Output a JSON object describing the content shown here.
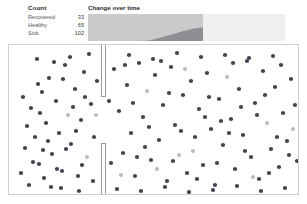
{
  "legend": {
    "title": "Count",
    "rows": [
      {
        "label": "Recovered",
        "value": "33"
      },
      {
        "label": "Healthy",
        "value": "65"
      },
      {
        "label": "Sick",
        "value": "102"
      }
    ]
  },
  "timeline": {
    "title": "Change over time"
  },
  "colors": {
    "sick_dot": "#3f4450",
    "recovered_dot": "#b9bcc4",
    "healthy_dot": "#6f7480",
    "area_band_dark": "#8d8f93",
    "area_band_light": "#c9cacc",
    "chart_background": "#f1f1f1",
    "panel_border": "#cfcfcf",
    "wall": "#9b9b9b",
    "text": "#333333"
  },
  "chart_data": {
    "type": "area",
    "title": "Change over time",
    "xlabel": "",
    "ylabel": "",
    "grid": false,
    "legend_position": "none",
    "stacked": true,
    "xlim": [
      0,
      100
    ],
    "ylim": [
      0,
      200
    ],
    "x": [
      0,
      10,
      20,
      30,
      40,
      50,
      55,
      60,
      65,
      70,
      75,
      80,
      85,
      90,
      95,
      100
    ],
    "series": [
      {
        "name": "Sick",
        "color": "#c9cacc",
        "values": [
          200,
          200,
          200,
          200,
          200,
          198,
          192,
          182,
          170,
          158,
          146,
          134,
          122,
          112,
          104,
          100
        ]
      },
      {
        "name": "Recovered",
        "color": "#8d8f93",
        "values": [
          0,
          0,
          0,
          0,
          0,
          2,
          8,
          18,
          30,
          42,
          54,
          66,
          78,
          88,
          96,
          100
        ]
      }
    ],
    "annotations": [
      {
        "text": "elapsed portion shaded darker, remaining time lighter",
        "x": 100,
        "y": 0
      }
    ]
  },
  "simulation": {
    "label": "particle-simulation-field",
    "walls": [
      {
        "name": "upper-wall",
        "x": 92,
        "y": 0,
        "width": 4,
        "height": 52
      },
      {
        "name": "lower-wall",
        "x": 92,
        "y": 99,
        "width": 4,
        "height": 52
      }
    ],
    "dots": [
      {
        "x": 16,
        "y": 103,
        "t": "s"
      },
      {
        "x": 22,
        "y": 63,
        "t": "s"
      },
      {
        "x": 26,
        "y": 92,
        "t": "s"
      },
      {
        "x": 30,
        "y": 119,
        "t": "s"
      },
      {
        "x": 33,
        "y": 47,
        "t": "s"
      },
      {
        "x": 37,
        "y": 78,
        "t": "s"
      },
      {
        "x": 40,
        "y": 33,
        "t": "s"
      },
      {
        "x": 43,
        "y": 109,
        "t": "s"
      },
      {
        "x": 47,
        "y": 56,
        "t": "s"
      },
      {
        "x": 50,
        "y": 88,
        "t": "s"
      },
      {
        "x": 53,
        "y": 126,
        "t": "s"
      },
      {
        "x": 56,
        "y": 20,
        "t": "s"
      },
      {
        "x": 59,
        "y": 70,
        "t": "r"
      },
      {
        "x": 62,
        "y": 99,
        "t": "s"
      },
      {
        "x": 66,
        "y": 44,
        "t": "s"
      },
      {
        "x": 69,
        "y": 131,
        "t": "s"
      },
      {
        "x": 72,
        "y": 75,
        "t": "s"
      },
      {
        "x": 75,
        "y": 27,
        "t": "s"
      },
      {
        "x": 78,
        "y": 112,
        "t": "r"
      },
      {
        "x": 82,
        "y": 59,
        "t": "s"
      },
      {
        "x": 85,
        "y": 92,
        "t": "s"
      },
      {
        "x": 88,
        "y": 36,
        "t": "s"
      },
      {
        "x": 20,
        "y": 140,
        "t": "s"
      },
      {
        "x": 28,
        "y": 14,
        "t": "s"
      },
      {
        "x": 35,
        "y": 133,
        "t": "s"
      },
      {
        "x": 45,
        "y": 17,
        "t": "s"
      },
      {
        "x": 52,
        "y": 143,
        "t": "s"
      },
      {
        "x": 61,
        "y": 12,
        "t": "s"
      },
      {
        "x": 70,
        "y": 146,
        "t": "s"
      },
      {
        "x": 80,
        "y": 9,
        "t": "s"
      },
      {
        "x": 14,
        "y": 52,
        "t": "s"
      },
      {
        "x": 18,
        "y": 81,
        "t": "s"
      },
      {
        "x": 24,
        "y": 117,
        "t": "s"
      },
      {
        "x": 31,
        "y": 68,
        "t": "s"
      },
      {
        "x": 39,
        "y": 96,
        "t": "s"
      },
      {
        "x": 48,
        "y": 124,
        "t": "s"
      },
      {
        "x": 57,
        "y": 104,
        "t": "s"
      },
      {
        "x": 64,
        "y": 62,
        "t": "s"
      },
      {
        "x": 73,
        "y": 120,
        "t": "s"
      },
      {
        "x": 84,
        "y": 136,
        "t": "s"
      },
      {
        "x": 12,
        "y": 128,
        "t": "s"
      },
      {
        "x": 29,
        "y": 39,
        "t": "s"
      },
      {
        "x": 42,
        "y": 142,
        "t": "s"
      },
      {
        "x": 54,
        "y": 34,
        "t": "s"
      },
      {
        "x": 67,
        "y": 86,
        "t": "s"
      },
      {
        "x": 76,
        "y": 52,
        "t": "s"
      },
      {
        "x": 87,
        "y": 70,
        "t": "r"
      },
      {
        "x": 34,
        "y": 105,
        "t": "s"
      },
      {
        "x": 105,
        "y": 24,
        "t": "s"
      },
      {
        "x": 110,
        "y": 66,
        "t": "s"
      },
      {
        "x": 114,
        "y": 108,
        "t": "s"
      },
      {
        "x": 118,
        "y": 40,
        "t": "s"
      },
      {
        "x": 122,
        "y": 88,
        "t": "s"
      },
      {
        "x": 126,
        "y": 131,
        "t": "s"
      },
      {
        "x": 130,
        "y": 18,
        "t": "s"
      },
      {
        "x": 134,
        "y": 72,
        "t": "s"
      },
      {
        "x": 138,
        "y": 46,
        "t": "r"
      },
      {
        "x": 142,
        "y": 115,
        "t": "s"
      },
      {
        "x": 146,
        "y": 30,
        "t": "s"
      },
      {
        "x": 150,
        "y": 95,
        "t": "s"
      },
      {
        "x": 154,
        "y": 60,
        "t": "s"
      },
      {
        "x": 158,
        "y": 136,
        "t": "s"
      },
      {
        "x": 162,
        "y": 22,
        "t": "s"
      },
      {
        "x": 166,
        "y": 80,
        "t": "s"
      },
      {
        "x": 170,
        "y": 110,
        "t": "r"
      },
      {
        "x": 174,
        "y": 50,
        "t": "s"
      },
      {
        "x": 178,
        "y": 128,
        "t": "s"
      },
      {
        "x": 182,
        "y": 36,
        "t": "s"
      },
      {
        "x": 186,
        "y": 92,
        "t": "s"
      },
      {
        "x": 190,
        "y": 64,
        "t": "s"
      },
      {
        "x": 194,
        "y": 120,
        "t": "s"
      },
      {
        "x": 198,
        "y": 28,
        "t": "s"
      },
      {
        "x": 202,
        "y": 84,
        "t": "s"
      },
      {
        "x": 206,
        "y": 140,
        "t": "s"
      },
      {
        "x": 210,
        "y": 54,
        "t": "s"
      },
      {
        "x": 214,
        "y": 100,
        "t": "s"
      },
      {
        "x": 218,
        "y": 32,
        "t": "r"
      },
      {
        "x": 222,
        "y": 74,
        "t": "s"
      },
      {
        "x": 226,
        "y": 124,
        "t": "s"
      },
      {
        "x": 230,
        "y": 44,
        "t": "s"
      },
      {
        "x": 234,
        "y": 90,
        "t": "s"
      },
      {
        "x": 238,
        "y": 16,
        "t": "s"
      },
      {
        "x": 242,
        "y": 112,
        "t": "s"
      },
      {
        "x": 246,
        "y": 58,
        "t": "s"
      },
      {
        "x": 250,
        "y": 134,
        "t": "s"
      },
      {
        "x": 254,
        "y": 26,
        "t": "s"
      },
      {
        "x": 258,
        "y": 78,
        "t": "r"
      },
      {
        "x": 262,
        "y": 104,
        "t": "s"
      },
      {
        "x": 266,
        "y": 42,
        "t": "s"
      },
      {
        "x": 270,
        "y": 122,
        "t": "s"
      },
      {
        "x": 274,
        "y": 68,
        "t": "s"
      },
      {
        "x": 278,
        "y": 96,
        "t": "s"
      },
      {
        "x": 282,
        "y": 34,
        "t": "s"
      },
      {
        "x": 108,
        "y": 144,
        "t": "s"
      },
      {
        "x": 120,
        "y": 10,
        "t": "s"
      },
      {
        "x": 132,
        "y": 146,
        "t": "s"
      },
      {
        "x": 144,
        "y": 14,
        "t": "s"
      },
      {
        "x": 156,
        "y": 142,
        "t": "s"
      },
      {
        "x": 168,
        "y": 8,
        "t": "s"
      },
      {
        "x": 180,
        "y": 147,
        "t": "s"
      },
      {
        "x": 192,
        "y": 12,
        "t": "s"
      },
      {
        "x": 204,
        "y": 145,
        "t": "s"
      },
      {
        "x": 216,
        "y": 10,
        "t": "s"
      },
      {
        "x": 228,
        "y": 141,
        "t": "s"
      },
      {
        "x": 240,
        "y": 13,
        "t": "s"
      },
      {
        "x": 252,
        "y": 146,
        "t": "s"
      },
      {
        "x": 264,
        "y": 11,
        "t": "s"
      },
      {
        "x": 276,
        "y": 143,
        "t": "s"
      },
      {
        "x": 286,
        "y": 60,
        "t": "s"
      },
      {
        "x": 288,
        "y": 116,
        "t": "s"
      },
      {
        "x": 100,
        "y": 56,
        "t": "s"
      },
      {
        "x": 102,
        "y": 118,
        "t": "s"
      },
      {
        "x": 112,
        "y": 130,
        "t": "r"
      },
      {
        "x": 124,
        "y": 58,
        "t": "s"
      },
      {
        "x": 136,
        "y": 102,
        "t": "s"
      },
      {
        "x": 148,
        "y": 124,
        "t": "r"
      },
      {
        "x": 160,
        "y": 48,
        "t": "s"
      },
      {
        "x": 172,
        "y": 86,
        "t": "s"
      },
      {
        "x": 184,
        "y": 106,
        "t": "r"
      },
      {
        "x": 196,
        "y": 72,
        "t": "s"
      },
      {
        "x": 208,
        "y": 118,
        "t": "s"
      },
      {
        "x": 220,
        "y": 88,
        "t": "s"
      },
      {
        "x": 232,
        "y": 62,
        "t": "s"
      },
      {
        "x": 244,
        "y": 132,
        "t": "r"
      },
      {
        "x": 256,
        "y": 50,
        "t": "s"
      },
      {
        "x": 268,
        "y": 92,
        "t": "s"
      },
      {
        "x": 280,
        "y": 110,
        "t": "s"
      },
      {
        "x": 116,
        "y": 20,
        "t": "s"
      },
      {
        "x": 128,
        "y": 112,
        "t": "s"
      },
      {
        "x": 140,
        "y": 82,
        "t": "s"
      },
      {
        "x": 152,
        "y": 16,
        "t": "s"
      },
      {
        "x": 164,
        "y": 116,
        "t": "s"
      },
      {
        "x": 176,
        "y": 24,
        "t": "r"
      },
      {
        "x": 188,
        "y": 134,
        "t": "s"
      },
      {
        "x": 200,
        "y": 52,
        "t": "s"
      },
      {
        "x": 212,
        "y": 76,
        "t": "s"
      },
      {
        "x": 224,
        "y": 18,
        "t": "s"
      },
      {
        "x": 236,
        "y": 106,
        "t": "s"
      },
      {
        "x": 248,
        "y": 70,
        "t": "s"
      },
      {
        "x": 260,
        "y": 128,
        "t": "s"
      },
      {
        "x": 272,
        "y": 20,
        "t": "s"
      },
      {
        "x": 284,
        "y": 84,
        "t": "r"
      }
    ]
  }
}
